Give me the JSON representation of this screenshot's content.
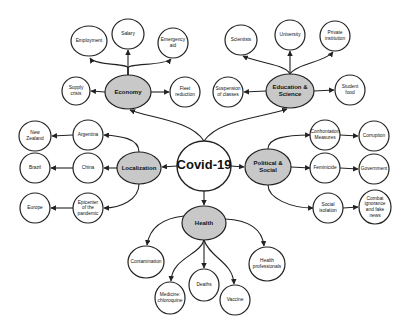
{
  "diagram": {
    "type": "mind-map",
    "root": {
      "id": "covid",
      "label": "Covid-19",
      "x": 204,
      "y": 166,
      "rx": 27,
      "ry": 25
    },
    "hubs": [
      {
        "id": "economy",
        "label": [
          "Economy"
        ],
        "x": 128,
        "y": 92,
        "rx": 23,
        "ry": 17
      },
      {
        "id": "education",
        "label": [
          "Education &",
          "Science"
        ],
        "x": 290,
        "y": 91,
        "rx": 24,
        "ry": 17
      },
      {
        "id": "localization",
        "label": [
          "Localization"
        ],
        "x": 139,
        "y": 168,
        "rx": 22,
        "ry": 16
      },
      {
        "id": "political",
        "label": [
          "Political &",
          "Social"
        ],
        "x": 268,
        "y": 167,
        "rx": 23,
        "ry": 18
      },
      {
        "id": "health",
        "label": [
          "Health"
        ],
        "x": 204,
        "y": 223,
        "rx": 22,
        "ry": 17
      }
    ],
    "leaves": [
      {
        "id": "employment",
        "label": [
          "Employment"
        ],
        "x": 89,
        "y": 41,
        "rx": 18,
        "ry": 15
      },
      {
        "id": "salary",
        "label": [
          "Salary"
        ],
        "x": 128,
        "y": 34,
        "rx": 16,
        "ry": 15
      },
      {
        "id": "emergency",
        "label": [
          "Emergency",
          "aid"
        ],
        "x": 173,
        "y": 43,
        "rx": 15,
        "ry": 15
      },
      {
        "id": "supply",
        "label": [
          "Supply",
          "crisis"
        ],
        "x": 76,
        "y": 91,
        "rx": 14,
        "ry": 14
      },
      {
        "id": "fleet",
        "label": [
          "Fleet",
          "reduction"
        ],
        "x": 185,
        "y": 92,
        "rx": 15,
        "ry": 15
      },
      {
        "id": "scientists",
        "label": [
          "Scientists"
        ],
        "x": 241,
        "y": 40,
        "rx": 16,
        "ry": 15
      },
      {
        "id": "university",
        "label": [
          "University"
        ],
        "x": 290,
        "y": 35,
        "rx": 15,
        "ry": 15
      },
      {
        "id": "private",
        "label": [
          "Private",
          "institution"
        ],
        "x": 335,
        "y": 36,
        "rx": 15,
        "ry": 15
      },
      {
        "id": "suspension",
        "label": [
          "Suspension",
          "of classes"
        ],
        "x": 228,
        "y": 92,
        "rx": 15,
        "ry": 15
      },
      {
        "id": "studentfood",
        "label": [
          "Student",
          "food"
        ],
        "x": 350,
        "y": 90,
        "rx": 15,
        "ry": 15
      },
      {
        "id": "newzealand",
        "label": [
          "New",
          "Zealand"
        ],
        "x": 35,
        "y": 136,
        "rx": 16,
        "ry": 15
      },
      {
        "id": "argentina",
        "label": [
          "Argentina"
        ],
        "x": 88,
        "y": 135,
        "rx": 15,
        "ry": 15
      },
      {
        "id": "brazil",
        "label": [
          "Brazil"
        ],
        "x": 35,
        "y": 168,
        "rx": 15,
        "ry": 15
      },
      {
        "id": "china",
        "label": [
          "China"
        ],
        "x": 88,
        "y": 168,
        "rx": 15,
        "ry": 15
      },
      {
        "id": "europe",
        "label": [
          "Europe"
        ],
        "x": 35,
        "y": 208,
        "rx": 15,
        "ry": 15
      },
      {
        "id": "epicenter",
        "label": [
          "Epicenter",
          "of the",
          "pandemic"
        ],
        "x": 88,
        "y": 208,
        "rx": 15,
        "ry": 15
      },
      {
        "id": "confrontation",
        "label": [
          "Confrontation",
          "Measures"
        ],
        "x": 325,
        "y": 135,
        "rx": 15,
        "ry": 15
      },
      {
        "id": "corruption",
        "label": [
          "Corruption"
        ],
        "x": 374,
        "y": 136,
        "rx": 15,
        "ry": 15
      },
      {
        "id": "feminicide",
        "label": [
          "Feminicide"
        ],
        "x": 325,
        "y": 168,
        "rx": 15,
        "ry": 15
      },
      {
        "id": "government",
        "label": [
          "Government"
        ],
        "x": 374,
        "y": 169,
        "rx": 15,
        "ry": 15
      },
      {
        "id": "isolation",
        "label": [
          "Social",
          "isolation"
        ],
        "x": 328,
        "y": 208,
        "rx": 15,
        "ry": 15
      },
      {
        "id": "combat",
        "label": [
          "Combat",
          "ignorance",
          "and fake",
          "news"
        ],
        "x": 375,
        "y": 207,
        "rx": 16,
        "ry": 17
      },
      {
        "id": "contamination",
        "label": [
          "Contamination"
        ],
        "x": 146,
        "y": 262,
        "rx": 18,
        "ry": 16
      },
      {
        "id": "medicine",
        "label": [
          "Medicine:",
          "chloroquine"
        ],
        "x": 170,
        "y": 298,
        "rx": 15,
        "ry": 16
      },
      {
        "id": "deaths",
        "label": [
          "Deaths"
        ],
        "x": 204,
        "y": 285,
        "rx": 15,
        "ry": 16
      },
      {
        "id": "vaccine",
        "label": [
          "Vaccine"
        ],
        "x": 235,
        "y": 300,
        "rx": 15,
        "ry": 15
      },
      {
        "id": "healthpro",
        "label": [
          "Health",
          "professionals"
        ],
        "x": 267,
        "y": 264,
        "rx": 18,
        "ry": 17
      }
    ],
    "edges": [
      {
        "from": "covid",
        "to": "economy",
        "d": "M204,141 C190,120 150,118 130,110"
      },
      {
        "from": "covid",
        "to": "education",
        "d": "M204,141 C218,120 260,118 287,109"
      },
      {
        "from": "covid",
        "to": "localization",
        "d": "M177,166 L162,167"
      },
      {
        "from": "covid",
        "to": "political",
        "d": "M231,166 L244,167"
      },
      {
        "from": "covid",
        "to": "health",
        "d": "M204,191 L204,205"
      },
      {
        "from": "economy",
        "to": "employment",
        "d": "M128,75 L128,68 C128,63 95,66 90,58"
      },
      {
        "from": "economy",
        "to": "salary",
        "d": "M128,75 L128,50"
      },
      {
        "from": "economy",
        "to": "emergency",
        "d": "M128,75 L128,68 C128,63 165,66 171,59"
      },
      {
        "from": "economy",
        "to": "supply",
        "d": "M105,92 L91,91"
      },
      {
        "from": "economy",
        "to": "fleet",
        "d": "M151,92 L169,92"
      },
      {
        "from": "education",
        "to": "scientists",
        "d": "M290,74 C285,64 255,62 243,56"
      },
      {
        "from": "education",
        "to": "university",
        "d": "M290,74 L290,51"
      },
      {
        "from": "education",
        "to": "private",
        "d": "M290,74 C296,64 325,62 333,52"
      },
      {
        "from": "education",
        "to": "suspension",
        "d": "M266,91 L244,92"
      },
      {
        "from": "education",
        "to": "studentfood",
        "d": "M314,91 L334,90"
      },
      {
        "from": "localization",
        "to": "argentina",
        "d": "M139,152 C139,138 120,136 104,135"
      },
      {
        "from": "localization",
        "to": "china",
        "d": "M117,168 L104,168"
      },
      {
        "from": "localization",
        "to": "epicenter",
        "d": "M139,184 C139,200 120,208 104,208"
      },
      {
        "from": "argentina",
        "to": "newzealand",
        "d": "M73,135 L52,136"
      },
      {
        "from": "china",
        "to": "brazil",
        "d": "M73,168 L51,168"
      },
      {
        "from": "epicenter",
        "to": "europe",
        "d": "M73,208 L51,208"
      },
      {
        "from": "political",
        "to": "confrontation",
        "d": "M268,149 C268,138 285,135 310,135"
      },
      {
        "from": "political",
        "to": "feminicide",
        "d": "M291,167 L310,168"
      },
      {
        "from": "political",
        "to": "isolation",
        "d": "M268,185 C268,198 290,208 313,208"
      },
      {
        "from": "confrontation",
        "to": "corruption",
        "d": "M340,135 L358,136"
      },
      {
        "from": "feminicide",
        "to": "government",
        "d": "M340,168 L358,169"
      },
      {
        "from": "isolation",
        "to": "combat",
        "d": "M343,208 L358,207"
      },
      {
        "from": "health",
        "to": "contamination",
        "d": "M184,216 C165,218 150,225 147,245"
      },
      {
        "from": "health",
        "to": "medicine",
        "d": "M204,240 C200,255 172,258 171,281"
      },
      {
        "from": "health",
        "to": "deaths",
        "d": "M204,240 L204,268"
      },
      {
        "from": "health",
        "to": "vaccine",
        "d": "M204,240 C210,258 233,262 234,284"
      },
      {
        "from": "health",
        "to": "healthpro",
        "d": "M225,219 C248,220 262,228 264,246"
      }
    ]
  }
}
